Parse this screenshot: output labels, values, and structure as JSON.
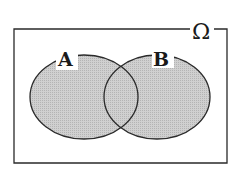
{
  "diagram": {
    "type": "venn",
    "universe_label": "Ω",
    "sets": [
      {
        "label": "A"
      },
      {
        "label": "B"
      }
    ],
    "shaded_region": "A ∪ B",
    "colors": {
      "fill": "#c8c8c8",
      "stroke": "#2a2a2a",
      "background": "#ffffff"
    }
  }
}
